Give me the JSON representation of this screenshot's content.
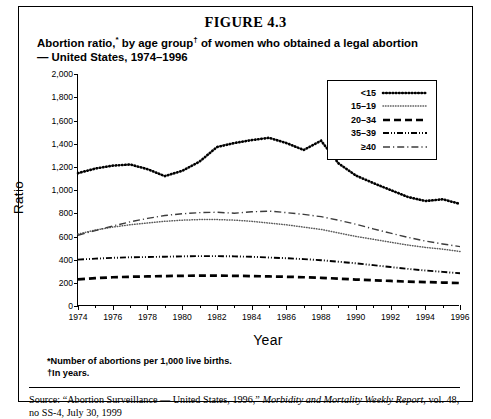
{
  "figure_number": "FIGURE 4.3",
  "title_line1": "Abortion ratio,* by age group† of women who obtained a legal abortion",
  "title_line2": "— United States, 1974–1996",
  "axis": {
    "ylabel": "Ratio",
    "xlabel": "Year"
  },
  "notes": {
    "note1": "*Number of abortions per 1,000 live births.",
    "note2": "†In years."
  },
  "source": {
    "prefix": "Source: “Abortion Surveillance — United States, 1996,” ",
    "italic": "Morbidity and Mortality Weekly Report",
    "suffix": ", vol. 48, no SS-4, July 30, 1999"
  },
  "legend": {
    "items": [
      {
        "label": "<15",
        "style": "dotted"
      },
      {
        "label": "15–19",
        "style": "fine-dotted"
      },
      {
        "label": "20–34",
        "style": "dashed"
      },
      {
        "label": "35–39",
        "style": "dash-dot-dot"
      },
      {
        "label": "≥40",
        "style": "dash-dot"
      }
    ]
  },
  "chart_data": {
    "type": "line",
    "title": "Abortion ratio,* by age group† of women who obtained a legal abortion — United States, 1974–1996",
    "xlabel": "Year",
    "ylabel": "Ratio",
    "xlim": [
      1974,
      1996
    ],
    "ylim": [
      0,
      2000
    ],
    "ytick_values": [
      0,
      200,
      400,
      600,
      800,
      1000,
      1200,
      1400,
      1600,
      1800,
      2000
    ],
    "ytick_labels": [
      "0",
      "200",
      "400",
      "600",
      "800",
      "1,000",
      "1,200",
      "1,400",
      "1,600",
      "1,800",
      "2,000"
    ],
    "xtick_labels": [
      "1974",
      "1976",
      "1978",
      "1980",
      "1982",
      "1984",
      "1986",
      "1988",
      "1990",
      "1992",
      "1994",
      "1996"
    ],
    "xtick_values": [
      1974,
      1976,
      1978,
      1980,
      1982,
      1984,
      1986,
      1988,
      1990,
      1992,
      1994,
      1996
    ],
    "x": [
      1974,
      1975,
      1976,
      1977,
      1978,
      1979,
      1980,
      1981,
      1982,
      1983,
      1984,
      1985,
      1986,
      1987,
      1988,
      1989,
      1990,
      1991,
      1992,
      1993,
      1994,
      1995,
      1996
    ],
    "grid": false,
    "legend_position": "upper-right-inside",
    "series": [
      {
        "name": "<15",
        "style": "dotted",
        "values": [
          1145,
          1185,
          1210,
          1220,
          1180,
          1120,
          1165,
          1245,
          1370,
          1405,
          1430,
          1450,
          1405,
          1345,
          1425,
          1230,
          1125,
          1060,
          1000,
          940,
          905,
          920,
          880
        ]
      },
      {
        "name": "15–19",
        "style": "fine-dotted",
        "values": [
          620,
          655,
          680,
          700,
          715,
          730,
          740,
          745,
          745,
          740,
          730,
          715,
          700,
          680,
          660,
          630,
          600,
          575,
          550,
          525,
          505,
          490,
          470
        ]
      },
      {
        "name": "20–34",
        "style": "dashed",
        "values": [
          230,
          240,
          248,
          252,
          255,
          258,
          260,
          262,
          262,
          260,
          258,
          255,
          252,
          248,
          243,
          236,
          228,
          222,
          216,
          210,
          206,
          202,
          198
        ]
      },
      {
        "name": "35–39",
        "style": "dash-dot-dot",
        "values": [
          400,
          408,
          415,
          420,
          422,
          425,
          428,
          430,
          430,
          428,
          424,
          418,
          412,
          404,
          395,
          382,
          368,
          352,
          336,
          320,
          306,
          294,
          282
        ]
      },
      {
        "name": "≥40",
        "style": "dash-dot",
        "values": [
          610,
          650,
          690,
          725,
          755,
          780,
          795,
          805,
          808,
          800,
          812,
          818,
          805,
          790,
          770,
          740,
          705,
          665,
          628,
          592,
          560,
          535,
          512
        ]
      }
    ]
  }
}
